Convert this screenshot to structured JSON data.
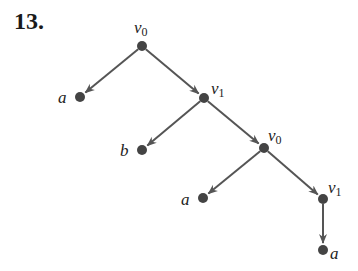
{
  "problem": {
    "number": "13."
  },
  "colors": {
    "edge": "#555555",
    "node": "#444444",
    "text": "#222222"
  },
  "tree": {
    "nodes": [
      {
        "id": "n0",
        "label": "v",
        "sub": "0",
        "x": 142,
        "y": 46,
        "lx": 134,
        "ly": 33
      },
      {
        "id": "n1",
        "label": "a",
        "sub": "",
        "x": 80,
        "y": 97,
        "lx": 58,
        "ly": 103
      },
      {
        "id": "n2",
        "label": "v",
        "sub": "1",
        "x": 204,
        "y": 98,
        "lx": 211,
        "ly": 94
      },
      {
        "id": "n3",
        "label": "b",
        "sub": "",
        "x": 142,
        "y": 150,
        "lx": 120,
        "ly": 156
      },
      {
        "id": "n4",
        "label": "v",
        "sub": "0",
        "x": 264,
        "y": 148,
        "lx": 268,
        "ly": 141
      },
      {
        "id": "n5",
        "label": "a",
        "sub": "",
        "x": 203,
        "y": 198,
        "lx": 181,
        "ly": 205
      },
      {
        "id": "n6",
        "label": "v",
        "sub": "1",
        "x": 323,
        "y": 199,
        "lx": 328,
        "ly": 193
      },
      {
        "id": "n7",
        "label": "a",
        "sub": "",
        "x": 323,
        "y": 250,
        "lx": 330,
        "ly": 259
      }
    ],
    "edges": [
      {
        "from": "n0",
        "to": "n1"
      },
      {
        "from": "n0",
        "to": "n2"
      },
      {
        "from": "n2",
        "to": "n3"
      },
      {
        "from": "n2",
        "to": "n4"
      },
      {
        "from": "n4",
        "to": "n5"
      },
      {
        "from": "n4",
        "to": "n6"
      },
      {
        "from": "n6",
        "to": "n7"
      }
    ]
  }
}
